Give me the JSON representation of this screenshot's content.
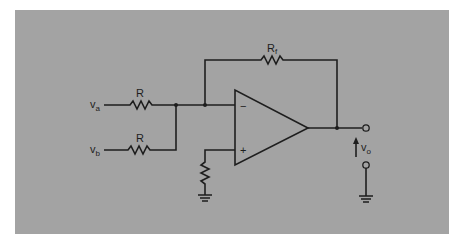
{
  "diagram": {
    "type": "summing-amplifier",
    "background_color": "#a3a3a3",
    "line_color": "#1e1e1e",
    "labels": {
      "input_a": {
        "main": "v",
        "sub": "a"
      },
      "input_b": {
        "main": "v",
        "sub": "b"
      },
      "resistor_a": "R",
      "resistor_b": "R",
      "feedback_resistor": {
        "main": "R",
        "sub": "f"
      },
      "output": {
        "main": "v",
        "sub": "o"
      },
      "inverting_input": "−",
      "noninverting_input": "+"
    }
  }
}
